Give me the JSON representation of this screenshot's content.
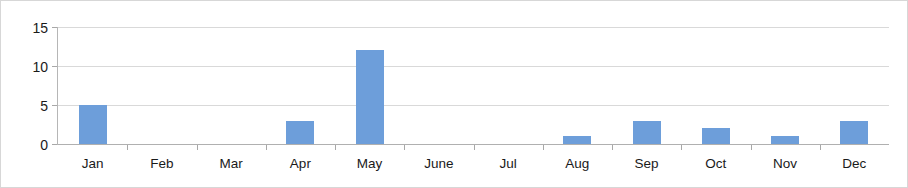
{
  "chart_data": {
    "type": "bar",
    "title": "",
    "subtitle": "",
    "xlabel": "",
    "ylabel": "",
    "categories": [
      "Jan",
      "Feb",
      "Mar",
      "Apr",
      "May",
      "June",
      "Jul",
      "Aug",
      "Sep",
      "Oct",
      "Nov",
      "Dec"
    ],
    "values": [
      5,
      0,
      0,
      3,
      12,
      0,
      0,
      1,
      3,
      2,
      1,
      3
    ],
    "ylim": [
      0,
      15
    ],
    "ytick_labels": [
      "15",
      "10",
      "5",
      "0"
    ],
    "ytick_values": [
      15,
      10,
      5,
      0
    ],
    "grid": true,
    "gridlines_at": [
      5,
      10,
      15
    ],
    "legend": "none",
    "legend_position": "none",
    "series": [
      {
        "name": "",
        "values": [
          5,
          0,
          0,
          3,
          12,
          0,
          0,
          1,
          3,
          2,
          1,
          3
        ]
      }
    ],
    "colors": {
      "bar": "#6d9eda",
      "gridline": "#d9d9d9",
      "axis": "#b0b0b0",
      "text": "#1a1a1a",
      "border": "#d7d7d7",
      "background": "#ffffff"
    }
  }
}
